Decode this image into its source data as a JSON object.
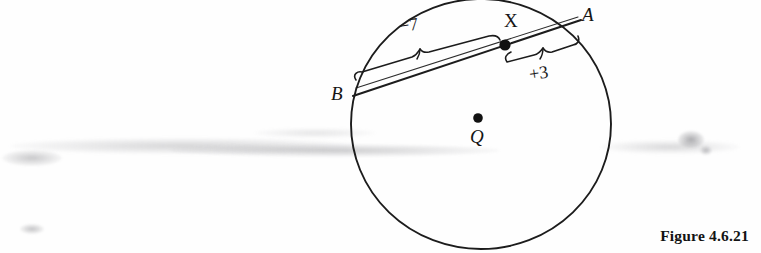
{
  "figure": {
    "caption": "Figure 4.6.21",
    "type": "circle-geometry-diagram",
    "background_color": "#fefefe",
    "ink_color": "#1a1a1a"
  },
  "labels": {
    "point_a": "A",
    "point_b": "B",
    "point_x": "X",
    "point_q": "Q",
    "segment_bx_measure": "−7",
    "segment_xa_measure": "+3"
  },
  "geometry": {
    "circle": {
      "cx": 481,
      "cy": 124,
      "r": 124
    },
    "points": {
      "A": {
        "x": 578,
        "y": 22
      },
      "B": {
        "x": 356,
        "y": 94
      },
      "X": {
        "x": 505,
        "y": 45
      },
      "Q": {
        "x": 478,
        "y": 118
      }
    },
    "chord": {
      "from": "B",
      "to": "A"
    },
    "braces": [
      {
        "label": "−7",
        "side": "above",
        "from": "B",
        "to": "X"
      },
      {
        "label": "+3",
        "side": "below",
        "from": "X",
        "to": "A"
      }
    ]
  },
  "label_positions": {
    "A": {
      "x": 582,
      "y": 5
    },
    "B": {
      "x": 331,
      "y": 84
    },
    "X": {
      "x": 504,
      "y": 11
    },
    "Q": {
      "x": 470,
      "y": 127
    },
    "minus7": {
      "x": 399,
      "y": 16
    },
    "plus3": {
      "x": 529,
      "y": 64
    }
  }
}
